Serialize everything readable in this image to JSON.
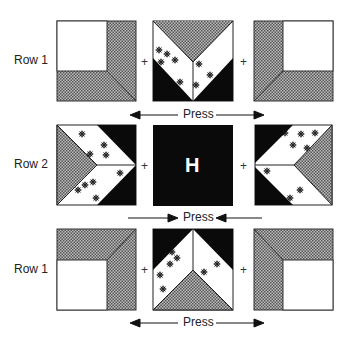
{
  "diagram": {
    "rows": [
      {
        "label": "Row 1",
        "y": 61,
        "blocks": [
          "corner-square-top-left",
          "v-flying-geese-down",
          "corner-square-top-right"
        ]
      },
      {
        "label": "Row 2",
        "y": 165,
        "blocks": [
          "chevron-right",
          "solid-center",
          "chevron-left"
        ]
      },
      {
        "label": "Row 1",
        "y": 270,
        "blocks": [
          "corner-square-bottom-left",
          "v-flying-geese-up",
          "corner-square-bottom-right"
        ]
      }
    ],
    "center_block_label": "H",
    "plus": "+",
    "press": [
      {
        "label": "Press",
        "direction": "outward"
      },
      {
        "label": "Press",
        "direction": "inward"
      },
      {
        "label": "Press",
        "direction": "outward"
      }
    ],
    "colors": {
      "dark": "#0a0a0a",
      "light": "#ffffff",
      "gray_print": "#8a8a8a",
      "outline": "#333333"
    }
  }
}
